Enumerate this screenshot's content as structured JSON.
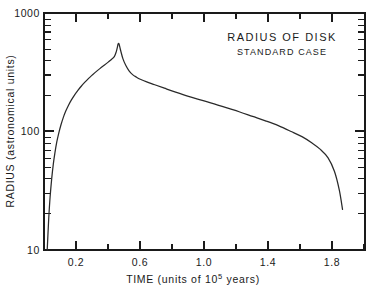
{
  "chart_data": {
    "type": "line",
    "title": "RADIUS OF DISK",
    "subtitle": "STANDARD CASE",
    "xlabel": "TIME (units of 10⁵ years)",
    "xlabel_prefix": "TIME (units of 10",
    "xlabel_exponent": "5",
    "xlabel_suffix": " years)",
    "ylabel": "RADIUS (astronomical units)",
    "xscale": "linear",
    "yscale": "log",
    "xlim": [
      0.0,
      2.0
    ],
    "ylim": [
      10,
      1000
    ],
    "grid": false,
    "legend": false,
    "x_ticks_major": [
      0.2,
      0.6,
      1.0,
      1.4,
      1.8
    ],
    "x_tick_labels": [
      "0.2",
      "0.6",
      "1.0",
      "1.4",
      "1.8"
    ],
    "x_ticks_minor": [
      0.4,
      0.8,
      1.2,
      1.6,
      2.0
    ],
    "y_ticks_major": [
      10,
      100,
      1000
    ],
    "y_tick_labels": [
      "10",
      "100",
      "1000"
    ],
    "y_ticks_minor": [
      20,
      30,
      40,
      50,
      60,
      70,
      80,
      90,
      200,
      300,
      400,
      500,
      600,
      700,
      800,
      900
    ],
    "series": [
      {
        "name": "Radius of disk, standard case",
        "x": [
          0.02,
          0.024,
          0.03,
          0.038,
          0.048,
          0.058,
          0.068,
          0.08,
          0.092,
          0.105,
          0.12,
          0.135,
          0.152,
          0.17,
          0.19,
          0.21,
          0.232,
          0.255,
          0.278,
          0.3,
          0.325,
          0.35,
          0.375,
          0.4,
          0.42,
          0.438,
          0.45,
          0.458,
          0.462,
          0.468,
          0.478,
          0.492,
          0.51,
          0.53,
          0.552,
          0.575,
          0.6,
          0.64,
          0.69,
          0.75,
          0.82,
          0.9,
          0.98,
          1.06,
          1.14,
          1.22,
          1.3,
          1.38,
          1.46,
          1.54,
          1.61,
          1.67,
          1.72,
          1.77,
          1.81,
          1.84,
          1.86
        ],
        "y": [
          10,
          13,
          19,
          28,
          40,
          53,
          66,
          82,
          97,
          113,
          131,
          148,
          166,
          184,
          203,
          221,
          241,
          261,
          281,
          299,
          320,
          341,
          362,
          385,
          405,
          428,
          470,
          520,
          550,
          545,
          480,
          410,
          360,
          325,
          302,
          288,
          276,
          262,
          248,
          232,
          215,
          198,
          184,
          171,
          158,
          146,
          134,
          123,
          112,
          100,
          90,
          80,
          71,
          60,
          46,
          32,
          22
        ],
        "peak": {
          "x": 0.462,
          "y": 550
        },
        "start": {
          "x": 0.02,
          "y": 10
        },
        "end": {
          "x": 1.86,
          "y": 22
        },
        "color": "#2a2a2a"
      }
    ]
  }
}
